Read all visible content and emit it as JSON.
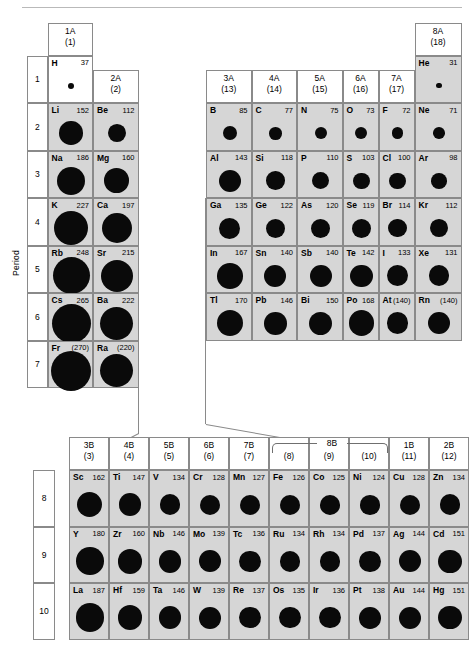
{
  "figure": {
    "period_axis_label": "Period",
    "paren_note": "values in parentheses are estimates"
  },
  "main_table": {
    "group_headers": [
      {
        "id": "1A",
        "top": "1A",
        "bottom": "(1)"
      },
      {
        "id": "2A",
        "top": "2A",
        "bottom": "(2)"
      },
      {
        "id": "3A",
        "top": "3A",
        "bottom": "(13)"
      },
      {
        "id": "4A",
        "top": "4A",
        "bottom": "(14)"
      },
      {
        "id": "5A",
        "top": "5A",
        "bottom": "(15)"
      },
      {
        "id": "6A",
        "top": "6A",
        "bottom": "(16)"
      },
      {
        "id": "7A",
        "top": "7A",
        "bottom": "(17)"
      },
      {
        "id": "8A",
        "top": "8A",
        "bottom": "(18)"
      }
    ],
    "periods": [
      "1",
      "2",
      "3",
      "4",
      "5",
      "6",
      "7"
    ],
    "elements": [
      {
        "sym": "H",
        "val": "37",
        "radius": 37,
        "col": 1,
        "row": 1,
        "shaded": false
      },
      {
        "sym": "He",
        "val": "31",
        "radius": 31,
        "col": 8,
        "row": 1,
        "shaded": true
      },
      {
        "sym": "Li",
        "val": "152",
        "radius": 152,
        "col": 1,
        "row": 2,
        "shaded": true
      },
      {
        "sym": "Be",
        "val": "112",
        "radius": 112,
        "col": 2,
        "row": 2,
        "shaded": true
      },
      {
        "sym": "B",
        "val": "85",
        "radius": 85,
        "col": 3,
        "row": 2,
        "shaded": true
      },
      {
        "sym": "C",
        "val": "77",
        "radius": 77,
        "col": 4,
        "row": 2,
        "shaded": true
      },
      {
        "sym": "N",
        "val": "75",
        "radius": 75,
        "col": 5,
        "row": 2,
        "shaded": true
      },
      {
        "sym": "O",
        "val": "73",
        "radius": 73,
        "col": 6,
        "row": 2,
        "shaded": true
      },
      {
        "sym": "F",
        "val": "72",
        "radius": 72,
        "col": 7,
        "row": 2,
        "shaded": true
      },
      {
        "sym": "Ne",
        "val": "71",
        "radius": 71,
        "col": 8,
        "row": 2,
        "shaded": true
      },
      {
        "sym": "Na",
        "val": "186",
        "radius": 186,
        "col": 1,
        "row": 3,
        "shaded": true
      },
      {
        "sym": "Mg",
        "val": "160",
        "radius": 160,
        "col": 2,
        "row": 3,
        "shaded": true
      },
      {
        "sym": "Al",
        "val": "143",
        "radius": 143,
        "col": 3,
        "row": 3,
        "shaded": true
      },
      {
        "sym": "Si",
        "val": "118",
        "radius": 118,
        "col": 4,
        "row": 3,
        "shaded": true
      },
      {
        "sym": "P",
        "val": "110",
        "radius": 110,
        "col": 5,
        "row": 3,
        "shaded": true
      },
      {
        "sym": "S",
        "val": "103",
        "radius": 103,
        "col": 6,
        "row": 3,
        "shaded": true
      },
      {
        "sym": "Cl",
        "val": "100",
        "radius": 100,
        "col": 7,
        "row": 3,
        "shaded": true
      },
      {
        "sym": "Ar",
        "val": "98",
        "radius": 98,
        "col": 8,
        "row": 3,
        "shaded": true
      },
      {
        "sym": "K",
        "val": "227",
        "radius": 227,
        "col": 1,
        "row": 4,
        "shaded": true
      },
      {
        "sym": "Ca",
        "val": "197",
        "radius": 197,
        "col": 2,
        "row": 4,
        "shaded": true
      },
      {
        "sym": "Ga",
        "val": "135",
        "radius": 135,
        "col": 3,
        "row": 4,
        "shaded": true
      },
      {
        "sym": "Ge",
        "val": "122",
        "radius": 122,
        "col": 4,
        "row": 4,
        "shaded": true
      },
      {
        "sym": "As",
        "val": "120",
        "radius": 120,
        "col": 5,
        "row": 4,
        "shaded": true
      },
      {
        "sym": "Se",
        "val": "119",
        "radius": 119,
        "col": 6,
        "row": 4,
        "shaded": true
      },
      {
        "sym": "Br",
        "val": "114",
        "radius": 114,
        "col": 7,
        "row": 4,
        "shaded": true
      },
      {
        "sym": "Kr",
        "val": "112",
        "radius": 112,
        "col": 8,
        "row": 4,
        "shaded": true
      },
      {
        "sym": "Rb",
        "val": "248",
        "radius": 248,
        "col": 1,
        "row": 5,
        "shaded": true
      },
      {
        "sym": "Sr",
        "val": "215",
        "radius": 215,
        "col": 2,
        "row": 5,
        "shaded": true
      },
      {
        "sym": "In",
        "val": "167",
        "radius": 167,
        "col": 3,
        "row": 5,
        "shaded": true
      },
      {
        "sym": "Sn",
        "val": "140",
        "radius": 140,
        "col": 4,
        "row": 5,
        "shaded": true
      },
      {
        "sym": "Sb",
        "val": "140",
        "radius": 140,
        "col": 5,
        "row": 5,
        "shaded": true
      },
      {
        "sym": "Te",
        "val": "142",
        "radius": 142,
        "col": 6,
        "row": 5,
        "shaded": true
      },
      {
        "sym": "I",
        "val": "133",
        "radius": 133,
        "col": 7,
        "row": 5,
        "shaded": true
      },
      {
        "sym": "Xe",
        "val": "131",
        "radius": 131,
        "col": 8,
        "row": 5,
        "shaded": true
      },
      {
        "sym": "Cs",
        "val": "265",
        "radius": 265,
        "col": 1,
        "row": 6,
        "shaded": true
      },
      {
        "sym": "Ba",
        "val": "222",
        "radius": 222,
        "col": 2,
        "row": 6,
        "shaded": true
      },
      {
        "sym": "Tl",
        "val": "170",
        "radius": 170,
        "col": 3,
        "row": 6,
        "shaded": true
      },
      {
        "sym": "Pb",
        "val": "146",
        "radius": 146,
        "col": 4,
        "row": 6,
        "shaded": true
      },
      {
        "sym": "Bi",
        "val": "150",
        "radius": 150,
        "col": 5,
        "row": 6,
        "shaded": true
      },
      {
        "sym": "Po",
        "val": "168",
        "radius": 168,
        "col": 6,
        "row": 6,
        "shaded": true
      },
      {
        "sym": "At",
        "val": "(140)",
        "radius": 140,
        "col": 7,
        "row": 6,
        "shaded": true
      },
      {
        "sym": "Rn",
        "val": "(140)",
        "radius": 140,
        "col": 8,
        "row": 6,
        "shaded": true
      },
      {
        "sym": "Fr",
        "val": "(270)",
        "radius": 270,
        "col": 1,
        "row": 7,
        "shaded": true
      },
      {
        "sym": "Ra",
        "val": "(220)",
        "radius": 220,
        "col": 2,
        "row": 7,
        "shaded": true
      }
    ]
  },
  "d_block": {
    "group_headers": [
      {
        "id": "3B",
        "top": "3B",
        "bottom": "(3)"
      },
      {
        "id": "4B",
        "top": "4B",
        "bottom": "(4)"
      },
      {
        "id": "5B",
        "top": "5B",
        "bottom": "(5)"
      },
      {
        "id": "6B",
        "top": "6B",
        "bottom": "(6)"
      },
      {
        "id": "7B",
        "top": "7B",
        "bottom": "(7)"
      },
      {
        "id": "8B-8",
        "top": "",
        "bottom": "(8)"
      },
      {
        "id": "8B-9",
        "top": "",
        "bottom": "(9)"
      },
      {
        "id": "8B-10",
        "top": "",
        "bottom": "(10)"
      },
      {
        "id": "1B",
        "top": "1B",
        "bottom": "(11)"
      },
      {
        "id": "2B",
        "top": "2B",
        "bottom": "(12)"
      }
    ],
    "bracket_label": "8B",
    "rows": [
      "8",
      "9",
      "10"
    ],
    "elements": [
      {
        "sym": "Sc",
        "val": "162",
        "radius": 162,
        "col": 1,
        "row": 1
      },
      {
        "sym": "Ti",
        "val": "147",
        "radius": 147,
        "col": 2,
        "row": 1
      },
      {
        "sym": "V",
        "val": "134",
        "radius": 134,
        "col": 3,
        "row": 1
      },
      {
        "sym": "Cr",
        "val": "128",
        "radius": 128,
        "col": 4,
        "row": 1
      },
      {
        "sym": "Mn",
        "val": "127",
        "radius": 127,
        "col": 5,
        "row": 1
      },
      {
        "sym": "Fe",
        "val": "126",
        "radius": 126,
        "col": 6,
        "row": 1
      },
      {
        "sym": "Co",
        "val": "125",
        "radius": 125,
        "col": 7,
        "row": 1
      },
      {
        "sym": "Ni",
        "val": "124",
        "radius": 124,
        "col": 8,
        "row": 1
      },
      {
        "sym": "Cu",
        "val": "128",
        "radius": 128,
        "col": 9,
        "row": 1
      },
      {
        "sym": "Zn",
        "val": "134",
        "radius": 134,
        "col": 10,
        "row": 1
      },
      {
        "sym": "Y",
        "val": "180",
        "radius": 180,
        "col": 1,
        "row": 2
      },
      {
        "sym": "Zr",
        "val": "160",
        "radius": 160,
        "col": 2,
        "row": 2
      },
      {
        "sym": "Nb",
        "val": "146",
        "radius": 146,
        "col": 3,
        "row": 2
      },
      {
        "sym": "Mo",
        "val": "139",
        "radius": 139,
        "col": 4,
        "row": 2
      },
      {
        "sym": "Tc",
        "val": "136",
        "radius": 136,
        "col": 5,
        "row": 2
      },
      {
        "sym": "Ru",
        "val": "134",
        "radius": 134,
        "col": 6,
        "row": 2
      },
      {
        "sym": "Rh",
        "val": "134",
        "radius": 134,
        "col": 7,
        "row": 2
      },
      {
        "sym": "Pd",
        "val": "137",
        "radius": 137,
        "col": 8,
        "row": 2
      },
      {
        "sym": "Ag",
        "val": "144",
        "radius": 144,
        "col": 9,
        "row": 2
      },
      {
        "sym": "Cd",
        "val": "151",
        "radius": 151,
        "col": 10,
        "row": 2
      },
      {
        "sym": "La",
        "val": "187",
        "radius": 187,
        "col": 1,
        "row": 3
      },
      {
        "sym": "Hf",
        "val": "159",
        "radius": 159,
        "col": 2,
        "row": 3
      },
      {
        "sym": "Ta",
        "val": "146",
        "radius": 146,
        "col": 3,
        "row": 3
      },
      {
        "sym": "W",
        "val": "139",
        "radius": 139,
        "col": 4,
        "row": 3
      },
      {
        "sym": "Re",
        "val": "137",
        "radius": 137,
        "col": 5,
        "row": 3
      },
      {
        "sym": "Os",
        "val": "135",
        "radius": 135,
        "col": 6,
        "row": 3
      },
      {
        "sym": "Ir",
        "val": "136",
        "radius": 136,
        "col": 7,
        "row": 3
      },
      {
        "sym": "Pt",
        "val": "138",
        "radius": 138,
        "col": 8,
        "row": 3
      },
      {
        "sym": "Au",
        "val": "144",
        "radius": 144,
        "col": 9,
        "row": 3
      },
      {
        "sym": "Hg",
        "val": "151",
        "radius": 151,
        "col": 10,
        "row": 3
      }
    ]
  },
  "chart_data": {
    "type": "table",
    "ylabel": "Period",
    "note": "Circle area scales with atomic radius; values in pm. Parenthesised values are estimates.",
    "series": [
      {
        "name": "Group 1A",
        "values": [
          37,
          152,
          186,
          227,
          248,
          265,
          270
        ]
      },
      {
        "name": "Group 2A",
        "values": [
          112,
          160,
          197,
          215,
          222,
          220
        ]
      },
      {
        "name": "Group 3A",
        "values": [
          85,
          143,
          135,
          167,
          170
        ]
      },
      {
        "name": "Group 4A",
        "values": [
          77,
          118,
          122,
          140,
          146
        ]
      },
      {
        "name": "Group 5A",
        "values": [
          75,
          110,
          120,
          140,
          150
        ]
      },
      {
        "name": "Group 6A",
        "values": [
          73,
          103,
          119,
          142,
          168
        ]
      },
      {
        "name": "Group 7A",
        "values": [
          72,
          100,
          114,
          133,
          140
        ]
      },
      {
        "name": "Group 8A",
        "values": [
          31,
          71,
          98,
          112,
          131,
          140
        ]
      }
    ]
  }
}
